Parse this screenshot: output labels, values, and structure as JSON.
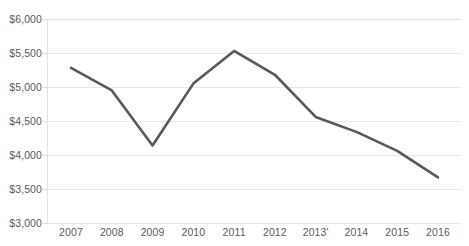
{
  "chart_data": {
    "type": "line",
    "title": "",
    "subtitle": "",
    "xlabel": "",
    "ylabel": "",
    "categories": [
      "2007",
      "2008",
      "2009",
      "2010",
      "2011",
      "2012",
      "2013'",
      "2014",
      "2015",
      "2016"
    ],
    "values": [
      5280,
      4950,
      4140,
      5050,
      5530,
      5180,
      4560,
      4340,
      4060,
      3670
    ],
    "series": [
      {
        "name": "",
        "values": [
          5280,
          4950,
          4140,
          5050,
          5530,
          5180,
          4560,
          4340,
          4060,
          3670
        ]
      }
    ],
    "ylim": [
      3000,
      6000
    ],
    "ytick_step": 500,
    "ytick_values": [
      6000,
      5500,
      5000,
      4500,
      4000,
      3500,
      3000
    ],
    "ytick_labels": [
      "$6,000",
      "$5,500",
      "$5,000",
      "$4,500",
      "$4,000",
      "$3,500",
      "$3,000"
    ],
    "grid": true,
    "grid_axis": "y",
    "legend": false,
    "legend_position": "none",
    "annotations": [],
    "colors": {
      "line": "#595959",
      "gridline": "#e8e8e8",
      "axis_text": "#5a5a5a",
      "background": "#ffffff"
    },
    "line_width": 2.6,
    "markers": false
  },
  "axes": {
    "y_labels": [
      "$6,000",
      "$5,500",
      "$5,000",
      "$4,500",
      "$4,000",
      "$3,500",
      "$3,000"
    ],
    "x_labels": [
      "2007",
      "2008",
      "2009",
      "2010",
      "2011",
      "2012",
      "2013'",
      "2014",
      "2015",
      "2016"
    ]
  }
}
